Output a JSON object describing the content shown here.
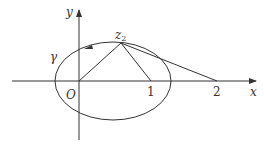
{
  "diagram": {
    "type": "complex-plane-figure",
    "axes": {
      "x_label": "x",
      "y_label": "y",
      "origin_label": "O"
    },
    "curve": {
      "label": "γ",
      "shape": "ellipse",
      "orientation": "counterclockwise"
    },
    "points": {
      "z2": {
        "label": "z",
        "subscript": "2"
      },
      "one": {
        "label": "1"
      },
      "two": {
        "label": "2"
      }
    },
    "segments": [
      {
        "from": "O",
        "to": "z2"
      },
      {
        "from": "z2",
        "to": "1"
      },
      {
        "from": "z2",
        "to": "2"
      }
    ],
    "colors": {
      "stroke": "#333333",
      "background": "#ffffff"
    }
  }
}
